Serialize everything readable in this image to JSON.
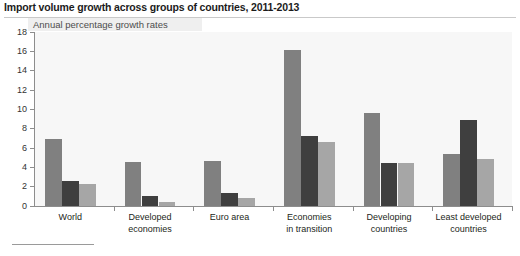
{
  "figure": {
    "title": "Import volume growth across groups of countries, 2011-2013",
    "subtitle": "Annual percentage growth rates"
  },
  "chart_data": {
    "type": "bar",
    "title": "Import volume growth across groups of countries, 2011-2013",
    "subtitle": "Annual percentage growth rates",
    "xlabel": "",
    "ylabel": "",
    "ylim": [
      0,
      18
    ],
    "yticks": [
      0,
      2,
      4,
      6,
      8,
      10,
      12,
      14,
      16,
      18
    ],
    "grid": false,
    "legend": "none",
    "categories": [
      "World",
      "Developed economies",
      "Euro area",
      "Economies in transition",
      "Developing countries",
      "Least developed countries"
    ],
    "category_lines": [
      [
        "World"
      ],
      [
        "Developed",
        "economies"
      ],
      [
        "Euro area"
      ],
      [
        "Economies",
        "in transition"
      ],
      [
        "Developing",
        "countries"
      ],
      [
        "Least developed",
        "countries"
      ]
    ],
    "series": [
      {
        "name": "2011",
        "color": "#808080",
        "values": [
          6.9,
          4.6,
          4.65,
          16.1,
          9.6,
          5.4
        ]
      },
      {
        "name": "2012",
        "color": "#3f3f3f",
        "values": [
          2.6,
          1.0,
          1.35,
          7.2,
          4.5,
          8.9
        ]
      },
      {
        "name": "2013",
        "color": "#a6a6a6",
        "values": [
          2.3,
          0.4,
          0.8,
          6.6,
          4.5,
          4.9
        ]
      }
    ]
  }
}
